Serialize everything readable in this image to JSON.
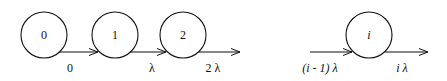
{
  "diagram": {
    "type": "birth-death chain",
    "states": [
      {
        "label": "0"
      },
      {
        "label": "1"
      },
      {
        "label": "2"
      },
      {
        "label": "i"
      }
    ],
    "transitions": [
      {
        "label": "0"
      },
      {
        "label": "λ"
      },
      {
        "label": "2 λ"
      },
      {
        "label": "(i - 1)  λ"
      },
      {
        "label": "i λ"
      }
    ],
    "colors": {
      "stroke": "#111111",
      "background": "#ffffff"
    }
  }
}
